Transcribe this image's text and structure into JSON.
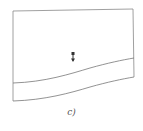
{
  "figure": {
    "caption": "c)",
    "marker": {
      "icon": "down-arrow-marker-icon",
      "color": "#333333"
    },
    "colors": {
      "stroke": "#777777",
      "background": "#ffffff"
    }
  }
}
